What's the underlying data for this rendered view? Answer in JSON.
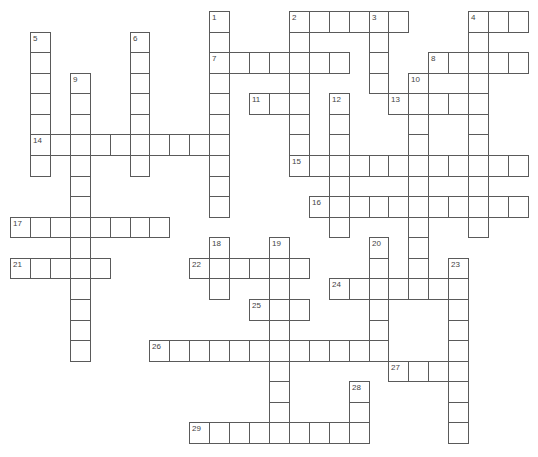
{
  "puzzle": {
    "type": "crossword",
    "grid": {
      "origin_x": 10,
      "origin_y": 11,
      "cell_w": 19.92,
      "cell_h": 20.57,
      "cols": 26,
      "rows": 21
    },
    "line_color": "#5a5a5a",
    "words": [
      {
        "number": "1",
        "dir": "down",
        "col": 10,
        "row": 0,
        "length": 10
      },
      {
        "number": "2",
        "dir": "across",
        "col": 14,
        "row": 0,
        "length": 6
      },
      {
        "number": "2",
        "dir": "down",
        "col": 14,
        "row": 0,
        "length": 8
      },
      {
        "number": "3",
        "dir": "down",
        "col": 18,
        "row": 0,
        "length": 4
      },
      {
        "number": "4",
        "dir": "across",
        "col": 23,
        "row": 0,
        "length": 3
      },
      {
        "number": "4",
        "dir": "down",
        "col": 23,
        "row": 0,
        "length": 11
      },
      {
        "number": "5",
        "dir": "down",
        "col": 1,
        "row": 1,
        "length": 7
      },
      {
        "number": "6",
        "dir": "down",
        "col": 6,
        "row": 1,
        "length": 7
      },
      {
        "number": "7",
        "dir": "across",
        "col": 10,
        "row": 2,
        "length": 7
      },
      {
        "number": "8",
        "dir": "across",
        "col": 21,
        "row": 2,
        "length": 5
      },
      {
        "number": "9",
        "dir": "down",
        "col": 3,
        "row": 3,
        "length": 14
      },
      {
        "number": "10",
        "dir": "down",
        "col": 20,
        "row": 3,
        "length": 11
      },
      {
        "number": "11",
        "dir": "across",
        "col": 12,
        "row": 4,
        "length": 3
      },
      {
        "number": "12",
        "dir": "down",
        "col": 16,
        "row": 4,
        "length": 7
      },
      {
        "number": "13",
        "dir": "across",
        "col": 19,
        "row": 4,
        "length": 5
      },
      {
        "number": "14",
        "dir": "across",
        "col": 1,
        "row": 6,
        "length": 10
      },
      {
        "number": "15",
        "dir": "across",
        "col": 14,
        "row": 7,
        "length": 12
      },
      {
        "number": "16",
        "dir": "across",
        "col": 15,
        "row": 9,
        "length": 11
      },
      {
        "number": "17",
        "dir": "across",
        "col": 0,
        "row": 10,
        "length": 8
      },
      {
        "number": "18",
        "dir": "down",
        "col": 10,
        "row": 11,
        "length": 3
      },
      {
        "number": "19",
        "dir": "down",
        "col": 13,
        "row": 11,
        "length": 10
      },
      {
        "number": "20",
        "dir": "down",
        "col": 18,
        "row": 11,
        "length": 6
      },
      {
        "number": "21",
        "dir": "across",
        "col": 0,
        "row": 12,
        "length": 5
      },
      {
        "number": "22",
        "dir": "across",
        "col": 9,
        "row": 12,
        "length": 6
      },
      {
        "number": "23",
        "dir": "down",
        "col": 22,
        "row": 12,
        "length": 9
      },
      {
        "number": "24",
        "dir": "across",
        "col": 16,
        "row": 13,
        "length": 7
      },
      {
        "number": "25",
        "dir": "across",
        "col": 12,
        "row": 14,
        "length": 3
      },
      {
        "number": "26",
        "dir": "across",
        "col": 7,
        "row": 16,
        "length": 12
      },
      {
        "number": "27",
        "dir": "across",
        "col": 19,
        "row": 17,
        "length": 4
      },
      {
        "number": "28",
        "dir": "down",
        "col": 17,
        "row": 18,
        "length": 3
      },
      {
        "number": "29",
        "dir": "across",
        "col": 9,
        "row": 20,
        "length": 9
      }
    ]
  }
}
